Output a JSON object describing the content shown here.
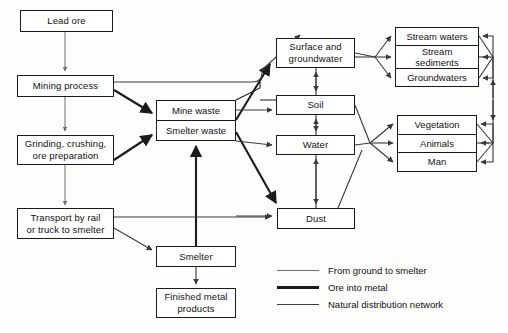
{
  "diagram": {
    "nodes": {
      "lead_ore": "Lead ore",
      "mining_process": "Mining process",
      "grinding_l1": "Grinding, crushing,",
      "grinding_l2": "ore preparation",
      "transport_l1": "Transport by rail",
      "transport_l2": "or truck to smelter",
      "mine_waste": "Mine waste",
      "smelter_waste": "Smelter waste",
      "smelter": "Smelter",
      "finished_l1": "Finished metal",
      "finished_l2": "products",
      "surface_l1": "Surface and",
      "surface_l2": "groundwater",
      "soil": "Soil",
      "water": "Water",
      "dust": "Dust",
      "stream_waters": "Stream waters",
      "stream_sediments_l1": "Stream",
      "stream_sediments_l2": "sediments",
      "groundwaters": "Groundwaters",
      "vegetation": "Vegetation",
      "animals": "Animals",
      "man": "Man"
    },
    "legend": [
      {
        "label": "From ground to smelter",
        "weight": "thin",
        "color": "#6f6f6f"
      },
      {
        "label": "Ore into metal",
        "weight": "thick",
        "color": "#1b1b1b"
      },
      {
        "label": "Natural distribution network",
        "weight": "medium",
        "color": "#3a3a3a"
      }
    ],
    "colors": {
      "stroke": "#1b1b1b",
      "thin_stroke": "#6f6f6f",
      "medium_stroke": "#3a3a3a",
      "box_fill": "#ffffff",
      "background": "#fdfdfb"
    }
  }
}
